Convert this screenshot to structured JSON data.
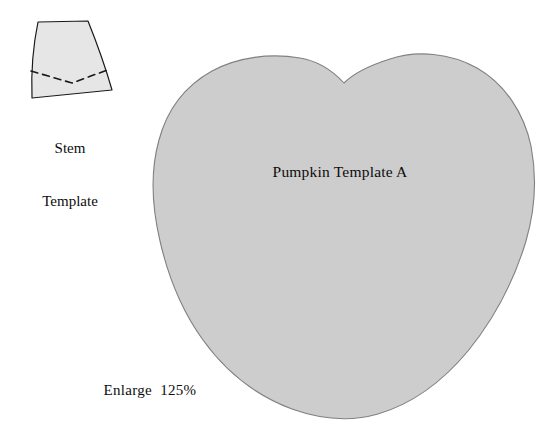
{
  "page": {
    "width": 559,
    "height": 432,
    "background_color": "#ffffff",
    "kind": "craft-template-sheet"
  },
  "colors": {
    "paper": "#ffffff",
    "pumpkin_fill": "#cdcdcd",
    "stem_fill": "#e6e6e6",
    "outline": "#4d4d4d",
    "stem_outline": "#1a1a1a",
    "dashed_fold_line": "#1a1a1a",
    "text": "#0d0d0d"
  },
  "stem": {
    "caption_line_1": "Stem",
    "caption_line_2": "Template",
    "fold_line_style": "dashed"
  },
  "pumpkin": {
    "label": "Pumpkin Template A"
  },
  "instructions": {
    "enlarge_note": "Enlarge  125%",
    "enlarge_percent": "125%"
  }
}
